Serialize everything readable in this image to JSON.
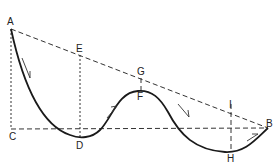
{
  "figure": {
    "points": {
      "A": "A",
      "B": "B",
      "C": "C",
      "D": "D",
      "E": "E",
      "F": "F",
      "G": "G",
      "H": "H",
      "I": "I"
    },
    "lines": [
      {
        "name": "chord-AB",
        "from": "A",
        "to": "B",
        "style": "dashed"
      },
      {
        "name": "baseline-CB",
        "from": "C",
        "to": "B",
        "style": "dashed"
      },
      {
        "name": "vertical-AC",
        "from": "A",
        "to": "C",
        "style": "dotted"
      },
      {
        "name": "vertical-ED",
        "from": "E",
        "to": "D",
        "style": "dotted"
      },
      {
        "name": "vertical-GF",
        "from": "G",
        "to": "F",
        "style": "dashed"
      },
      {
        "name": "vertical-IH",
        "from": "I",
        "to": "H",
        "style": "dashed"
      }
    ],
    "curve": {
      "path_through": [
        "A",
        "D",
        "F",
        "H",
        "B"
      ],
      "direction_arrows": [
        "A-D descending",
        "D-F ascending",
        "F-H descending",
        "H-B ascending"
      ]
    }
  }
}
